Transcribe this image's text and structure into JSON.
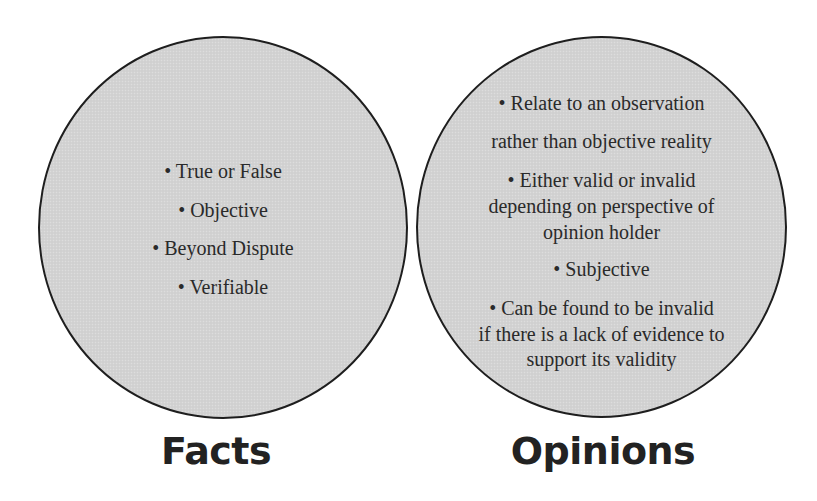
{
  "diagram": {
    "type": "two-circle comparison",
    "colors": {
      "circle_fill": "#d3d3d3",
      "circle_stroke": "#1e1e1e",
      "text": "#2a2a2a",
      "background": "#ffffff"
    },
    "facts": {
      "label": "Facts",
      "lines": [
        "• True or False",
        "• Objective",
        "• Beyond Dispute",
        "• Verifiable"
      ]
    },
    "opinions": {
      "label": "Opinions",
      "lines": [
        "• Relate to an observation",
        "rather than objective reality",
        "• Either valid or invalid",
        "depending on perspective of",
        "opinion holder",
        "• Subjective",
        "• Can be found to be invalid",
        "if there is a lack of evidence to",
        "support its validity"
      ]
    }
  }
}
